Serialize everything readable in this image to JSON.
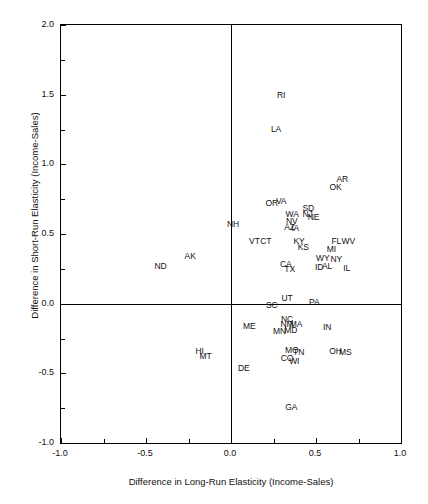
{
  "chart_data": {
    "type": "scatter",
    "title": "",
    "xlabel": "Difference in Long-Run Elasticity (Income-Sales)",
    "ylabel": "Difference in Short-Run Elasticity (Income-Sales)",
    "xlim": [
      -1.0,
      1.0
    ],
    "ylim": [
      -1.0,
      2.0
    ],
    "xticks": [
      -1.0,
      -0.5,
      0.0,
      0.5,
      1.0
    ],
    "xticklabels": [
      "-1.0",
      "-0.5",
      "0.0",
      "0.5",
      "1.0"
    ],
    "xminorticks": [
      -0.75,
      -0.25,
      0.25,
      0.75
    ],
    "yticks": [
      -1.0,
      -0.5,
      0.0,
      0.5,
      1.0,
      1.5,
      2.0
    ],
    "yticklabels": [
      "-1.0",
      "-0.5",
      "0.0",
      "0.5",
      "1.0",
      "1.5",
      "2.0"
    ],
    "yminorticks": [
      -0.75,
      -0.25,
      0.25,
      0.75,
      1.25,
      1.75
    ],
    "grid": false,
    "legend": null,
    "reference_lines": [
      {
        "orientation": "vertical",
        "value": 0.0
      },
      {
        "orientation": "horizontal",
        "value": 0.0
      }
    ],
    "marker_style": "text-label",
    "point_color": "#111111",
    "frame_color": "#000000",
    "points": [
      {
        "label": "RI",
        "x": 0.295,
        "y": 1.5
      },
      {
        "label": "LA",
        "x": 0.265,
        "y": 1.255
      },
      {
        "label": "AR",
        "x": 0.655,
        "y": 0.895
      },
      {
        "label": "OK",
        "x": 0.615,
        "y": 0.835
      },
      {
        "label": "OR",
        "x": 0.24,
        "y": 0.72
      },
      {
        "label": "VA",
        "x": 0.295,
        "y": 0.735
      },
      {
        "label": "SD",
        "x": 0.455,
        "y": 0.69
      },
      {
        "label": "WA",
        "x": 0.36,
        "y": 0.64
      },
      {
        "label": "NJ",
        "x": 0.45,
        "y": 0.64
      },
      {
        "label": "NE",
        "x": 0.485,
        "y": 0.625
      },
      {
        "label": "NV",
        "x": 0.358,
        "y": 0.592
      },
      {
        "label": "NH",
        "x": 0.012,
        "y": 0.57
      },
      {
        "label": "AZ",
        "x": 0.345,
        "y": 0.548
      },
      {
        "label": "IA",
        "x": 0.378,
        "y": 0.545
      },
      {
        "label": "VT",
        "x": 0.138,
        "y": 0.452
      },
      {
        "label": "CT",
        "x": 0.205,
        "y": 0.45
      },
      {
        "label": "KY",
        "x": 0.4,
        "y": 0.452
      },
      {
        "label": "FL",
        "x": 0.62,
        "y": 0.452
      },
      {
        "label": "WV",
        "x": 0.69,
        "y": 0.452
      },
      {
        "label": "KS",
        "x": 0.425,
        "y": 0.41
      },
      {
        "label": "MI",
        "x": 0.59,
        "y": 0.39
      },
      {
        "label": "AK",
        "x": -0.24,
        "y": 0.34
      },
      {
        "label": "WY",
        "x": 0.54,
        "y": 0.33
      },
      {
        "label": "NY",
        "x": 0.62,
        "y": 0.32
      },
      {
        "label": "CA",
        "x": 0.322,
        "y": 0.285
      },
      {
        "label": "ND",
        "x": -0.415,
        "y": 0.27
      },
      {
        "label": "ID",
        "x": 0.518,
        "y": 0.262
      },
      {
        "label": "AL",
        "x": 0.565,
        "y": 0.268
      },
      {
        "label": "IL",
        "x": 0.68,
        "y": 0.255
      },
      {
        "label": "TX",
        "x": 0.345,
        "y": 0.248
      },
      {
        "label": "UT",
        "x": 0.33,
        "y": 0.038
      },
      {
        "label": "SC",
        "x": 0.24,
        "y": -0.012
      },
      {
        "label": "PA",
        "x": 0.49,
        "y": 0.012
      },
      {
        "label": "NC",
        "x": 0.33,
        "y": -0.108
      },
      {
        "label": "NM",
        "x": 0.33,
        "y": -0.145
      },
      {
        "label": "MA",
        "x": 0.382,
        "y": -0.148
      },
      {
        "label": "ME",
        "x": 0.108,
        "y": -0.16
      },
      {
        "label": "IN",
        "x": 0.565,
        "y": -0.17
      },
      {
        "label": "MN",
        "x": 0.285,
        "y": -0.195
      },
      {
        "label": "MD",
        "x": 0.352,
        "y": -0.19
      },
      {
        "label": "HI",
        "x": -0.185,
        "y": -0.342
      },
      {
        "label": "MT",
        "x": -0.15,
        "y": -0.375
      },
      {
        "label": "MO",
        "x": 0.358,
        "y": -0.332
      },
      {
        "label": "TN",
        "x": 0.398,
        "y": -0.345
      },
      {
        "label": "OH",
        "x": 0.615,
        "y": -0.34
      },
      {
        "label": "MS",
        "x": 0.672,
        "y": -0.345
      },
      {
        "label": "CO",
        "x": 0.33,
        "y": -0.392
      },
      {
        "label": "WI",
        "x": 0.372,
        "y": -0.408
      },
      {
        "label": "DE",
        "x": 0.075,
        "y": -0.462
      },
      {
        "label": "GA",
        "x": 0.355,
        "y": -0.745
      }
    ]
  }
}
